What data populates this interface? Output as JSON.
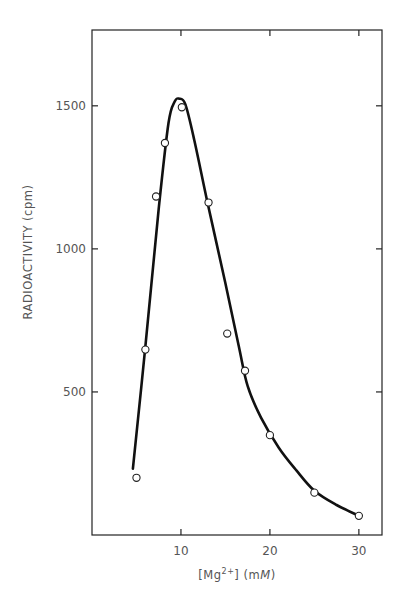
{
  "chart_data": {
    "type": "line",
    "title": "",
    "xlabel": "[Mg2+] (mM)",
    "xlabel_parts": {
      "open": "[Mg",
      "sup": "2+",
      "close": "] (m",
      "unit_italic": "M",
      "end": ")"
    },
    "ylabel": "RADIOACTIVITY (cpm)",
    "xlim": [
      0,
      32.6
    ],
    "ylim": [
      0,
      1765
    ],
    "x_ticks": [
      10,
      20,
      30
    ],
    "x_tick_labels": [
      "10",
      "20",
      "30"
    ],
    "y_ticks": [
      500,
      1000,
      1500
    ],
    "y_tick_labels": [
      "500",
      "1000",
      "1500"
    ],
    "grid": false,
    "legend": null,
    "series": [
      {
        "name": "measured",
        "marker": "open-circle",
        "x": [
          5.0,
          6.0,
          7.2,
          8.2,
          10.1,
          13.1,
          15.2,
          17.2,
          20.0,
          25.0,
          30.0
        ],
        "y": [
          200,
          648,
          1183,
          1370,
          1495,
          1162,
          704,
          574,
          349,
          148,
          67
        ]
      },
      {
        "name": "fitted curve",
        "marker": "none",
        "smooth": true,
        "x": [
          4.6,
          6.0,
          7.5,
          8.6,
          9.3,
          9.8,
          10.5,
          11.5,
          13.0,
          15.0,
          16.5,
          17.5,
          19.0,
          21.0,
          23.0,
          25.0,
          27.5,
          30.0
        ],
        "y": [
          232,
          660,
          1140,
          1440,
          1515,
          1525,
          1505,
          1380,
          1160,
          880,
          660,
          520,
          410,
          305,
          225,
          155,
          105,
          67
        ]
      }
    ]
  }
}
